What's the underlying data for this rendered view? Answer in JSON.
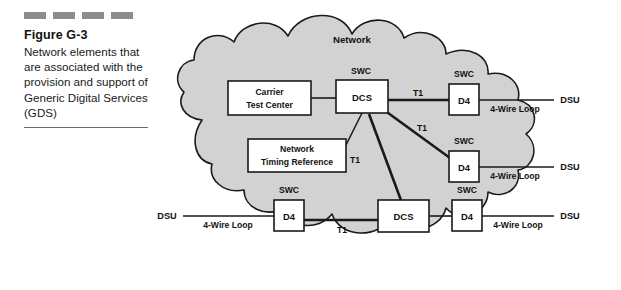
{
  "figure": {
    "number": "Figure G-3",
    "caption": "Network elements that are associated with the provision and support of Generic Digital Services (GDS)",
    "dash_count": 4,
    "dash_color": "#8c8c8c"
  },
  "diagram": {
    "cloud_label": "Network",
    "cloud_fill": "#d2d2d2",
    "cloud_stroke": "#1a1a1a",
    "box_fill": "#ffffff",
    "box_stroke": "#1a1a1a",
    "nodes": {
      "carrier_test_center": "Carrier\nTest Center",
      "carrier_test_center_line1": "Carrier",
      "carrier_test_center_line2": "Test Center",
      "network_timing_reference_line1": "Network",
      "network_timing_reference_line2": "Timing Reference",
      "dcs_top": "DCS",
      "dcs_bottom": "DCS",
      "d4_top_right": "D4",
      "d4_mid_right": "D4",
      "d4_bottom_left": "D4",
      "d4_bottom_right": "D4"
    },
    "swc_labels": [
      "SWC",
      "SWC",
      "SWC",
      "SWC",
      "SWC",
      "SWC"
    ],
    "trunk_labels": [
      "T1",
      "T1",
      "T1",
      "T1"
    ],
    "loop_labels": [
      "4-Wire Loop",
      "4-Wire Loop",
      "4-Wire Loop",
      "4-Wire Loop"
    ],
    "dsu_labels": [
      "DSU",
      "DSU",
      "DSU",
      "DSU"
    ]
  }
}
